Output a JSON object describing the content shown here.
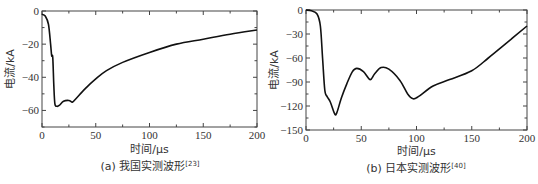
{
  "chart_data": [
    {
      "type": "line",
      "title": "",
      "caption": "(a) 我国实测波形",
      "caption_ref": "[23]",
      "xlabel": "时间/μs",
      "ylabel": "电流/kA",
      "xlim": [
        0,
        200
      ],
      "ylim": [
        -70,
        0
      ],
      "xticks": [
        0,
        50,
        100,
        150,
        200
      ],
      "yticks": [
        0,
        -20,
        -40,
        -60
      ],
      "grid": false,
      "x": [
        0,
        3,
        6,
        8,
        9,
        10,
        11,
        12,
        14,
        16,
        20,
        25,
        28,
        30,
        40,
        50,
        60,
        75,
        100,
        125,
        150,
        175,
        200
      ],
      "values": [
        -2,
        -3,
        -8,
        -20,
        -27,
        -28,
        -45,
        -56,
        -57.5,
        -57,
        -54.5,
        -54,
        -55,
        -54,
        -47,
        -41,
        -36,
        -31,
        -25,
        -20,
        -17,
        -14,
        -11.5
      ]
    },
    {
      "type": "line",
      "title": "",
      "caption": "(b) 日本实测波形",
      "caption_ref": "[40]",
      "xlabel": "时间/μs",
      "ylabel": "电流/kA",
      "xlim": [
        0,
        200
      ],
      "ylim": [
        -150,
        0
      ],
      "xticks": [
        0,
        50,
        100,
        150,
        200
      ],
      "yticks": [
        0,
        -30,
        -60,
        -90,
        -120,
        -150
      ],
      "grid": false,
      "x": [
        0,
        5,
        10,
        13,
        15,
        17,
        19,
        22,
        26,
        28,
        32,
        37,
        42,
        46,
        52,
        58,
        62,
        68,
        75,
        85,
        92,
        97,
        102,
        115,
        130,
        150,
        165,
        180,
        200
      ],
      "values": [
        0,
        -1,
        -5,
        -20,
        -60,
        -100,
        -108,
        -115,
        -130,
        -128,
        -110,
        -92,
        -77,
        -73,
        -77,
        -87,
        -80,
        -72,
        -74,
        -88,
        -105,
        -111,
        -108,
        -95,
        -87,
        -76,
        -60,
        -43,
        -20
      ]
    }
  ]
}
